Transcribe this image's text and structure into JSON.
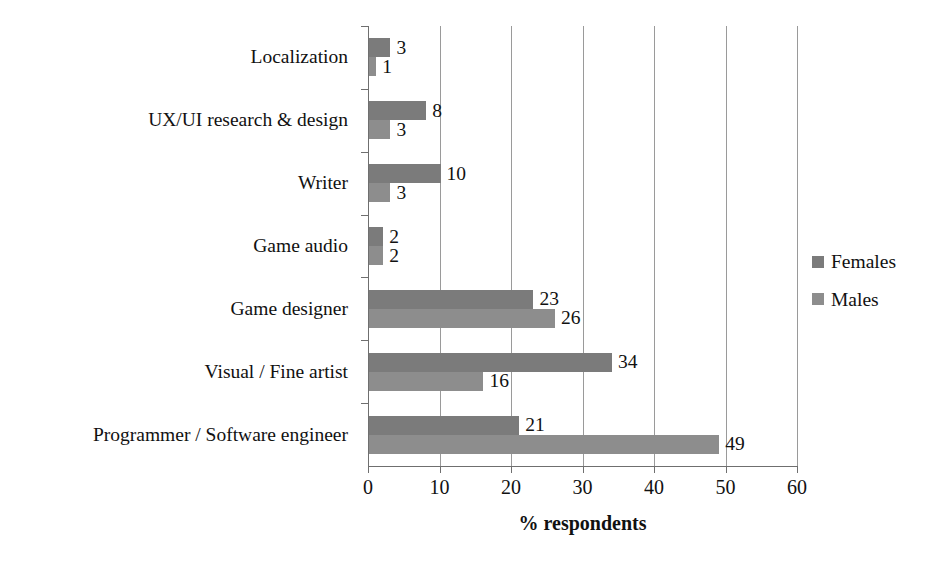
{
  "chart_data": {
    "type": "bar",
    "orientation": "horizontal",
    "grouped": true,
    "title": "",
    "xlabel": "% respondents",
    "ylabel": "",
    "xlim": [
      0,
      60
    ],
    "xticks": [
      0,
      10,
      20,
      30,
      40,
      50,
      60
    ],
    "grid": "vertical",
    "legend_position": "right",
    "categories": [
      "Localization",
      "UX/UI research & design",
      "Writer",
      "Game audio",
      "Game designer",
      "Visual / Fine artist",
      "Programmer / Software engineer"
    ],
    "series": [
      {
        "name": "Females",
        "color": "#7b7b7b",
        "values": [
          3,
          8,
          10,
          2,
          23,
          34,
          21
        ]
      },
      {
        "name": "Males",
        "color": "#8d8d8d",
        "values": [
          1,
          3,
          3,
          2,
          26,
          16,
          49
        ]
      }
    ],
    "data_labels": [
      {
        "category": "Localization",
        "females": "3",
        "males": "1"
      },
      {
        "category": "UX/UI research & design",
        "females": "8",
        "males": "3"
      },
      {
        "category": "Writer",
        "females": "10",
        "males": "3"
      },
      {
        "category": "Game audio",
        "females": "2",
        "males": "2"
      },
      {
        "category": "Game designer",
        "females": "23",
        "males": "26"
      },
      {
        "category": "Visual / Fine artist",
        "females": "34",
        "males": "16"
      },
      {
        "category": "Programmer / Software engineer",
        "females": "21",
        "males": "49"
      }
    ]
  },
  "legend": {
    "items": [
      {
        "label": "Females",
        "color": "#7b7b7b"
      },
      {
        "label": "Males",
        "color": "#8d8d8d"
      }
    ]
  },
  "axis": {
    "x_title": "% respondents",
    "x_tick_labels": [
      "0",
      "10",
      "20",
      "30",
      "40",
      "50",
      "60"
    ]
  }
}
